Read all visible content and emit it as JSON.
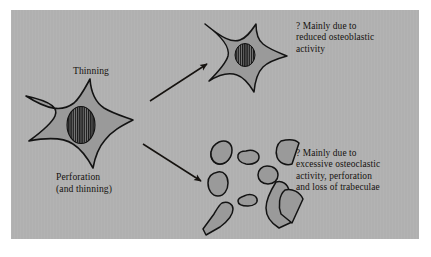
{
  "figure": {
    "background_color": "#b0b0b0",
    "page_color": "#ffffff",
    "ink_color": "#15120f",
    "bone_fill": "#9a9a9a",
    "marrow_fill": "#1a1a1a"
  },
  "labels": {
    "thinning": "Thinning",
    "perforation_line1": "Perforation",
    "perforation_line2": "(and thinning)"
  },
  "annotations": {
    "top": {
      "line1": "? Mainly due to",
      "line2": "reduced osteoblastic",
      "line3": "activity"
    },
    "bottom": {
      "line1": "? Mainly due to",
      "line2": "excessive osteoclastic",
      "line3": "activity, perforation",
      "line4": "and loss of trabeculae"
    }
  },
  "shapes": {
    "normal_trabecula": "normal-trabecula-star",
    "thinned_trabecula": "thinned-trabecula-star",
    "perforated_fragments_count": 9,
    "osteocyte_marker": "striped-ellipse"
  },
  "arrows": {
    "thinning_arrow": "arrow-up-right",
    "perforation_arrow": "arrow-down-right"
  }
}
